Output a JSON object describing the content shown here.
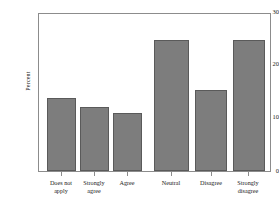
{
  "chart_data": {
    "type": "bar",
    "title": "",
    "xlabel": "",
    "ylabel": "Percent",
    "categories": [
      "Does not\napply",
      "Strongly\nagree",
      "Agree",
      "Neutral",
      "Disagree",
      "Strongly\ndisagree"
    ],
    "values": [
      14,
      12.3,
      11,
      25,
      15.5,
      25
    ],
    "ylim": [
      0,
      30
    ],
    "yticks": [
      0,
      10,
      20,
      30
    ],
    "ytick_labels": [
      "0",
      "10",
      "20",
      "30"
    ],
    "grid": false,
    "legend": false,
    "bar_color": "#7d7d7d",
    "bar_edge_color": "#5a5a5a",
    "axis_color": "#8c8c8c",
    "text_color": "#1a1a1a"
  }
}
